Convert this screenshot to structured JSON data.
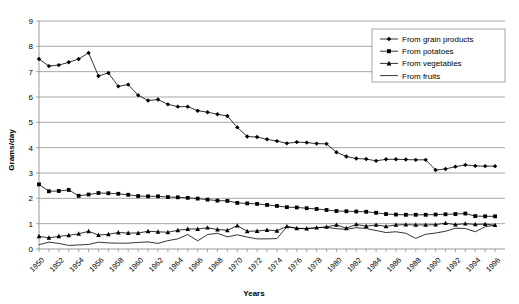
{
  "chart_data": {
    "type": "line",
    "title": "",
    "xlabel": "Years",
    "ylabel": "Grams/day",
    "xlim": [
      1950,
      1997
    ],
    "ylim": [
      0,
      9
    ],
    "ytick_values": [
      0,
      1,
      2,
      3,
      4,
      5,
      6,
      7,
      8,
      9
    ],
    "ytick_labels": [
      "0",
      "1",
      "2",
      "3",
      "4",
      "5",
      "6",
      "7",
      "8",
      "9"
    ],
    "xtick_labels": [
      "1950",
      "1952",
      "1954",
      "1956",
      "1958",
      "1960",
      "1962",
      "1964",
      "1966",
      "1968",
      "1970",
      "1972",
      "1974",
      "1976",
      "1978",
      "1980",
      "1982",
      "1984",
      "1986",
      "1988",
      "1990",
      "1992",
      "1994",
      "1996"
    ],
    "grid": "horizontal",
    "legend_position": "top-right",
    "x": [
      1950,
      1951,
      1952,
      1953,
      1954,
      1955,
      1956,
      1957,
      1958,
      1959,
      1960,
      1961,
      1962,
      1963,
      1964,
      1965,
      1966,
      1967,
      1968,
      1969,
      1970,
      1971,
      1972,
      1973,
      1974,
      1975,
      1976,
      1977,
      1978,
      1979,
      1980,
      1981,
      1982,
      1983,
      1984,
      1985,
      1986,
      1987,
      1988,
      1989,
      1990,
      1991,
      1992,
      1993,
      1994,
      1995,
      1996
    ],
    "series": [
      {
        "name": "From grain products",
        "marker": "diamond",
        "values": [
          7.5,
          7.22,
          7.26,
          7.37,
          7.5,
          7.74,
          6.83,
          6.95,
          6.42,
          6.49,
          6.07,
          5.86,
          5.9,
          5.71,
          5.62,
          5.62,
          5.46,
          5.4,
          5.32,
          5.25,
          4.8,
          4.44,
          4.42,
          4.33,
          4.26,
          4.17,
          4.22,
          4.2,
          4.16,
          4.15,
          3.82,
          3.65,
          3.57,
          3.55,
          3.48,
          3.54,
          3.54,
          3.53,
          3.52,
          3.52,
          3.12,
          3.16,
          3.25,
          3.32,
          3.28,
          3.27,
          3.27
        ]
      },
      {
        "name": "From potatoes",
        "marker": "square",
        "values": [
          2.55,
          2.28,
          2.29,
          2.33,
          2.1,
          2.15,
          2.21,
          2.2,
          2.18,
          2.14,
          2.09,
          2.08,
          2.08,
          2.05,
          2.04,
          2.02,
          1.99,
          1.95,
          1.91,
          1.9,
          1.82,
          1.8,
          1.78,
          1.74,
          1.7,
          1.65,
          1.64,
          1.61,
          1.58,
          1.54,
          1.5,
          1.49,
          1.48,
          1.47,
          1.43,
          1.38,
          1.36,
          1.35,
          1.35,
          1.35,
          1.36,
          1.37,
          1.38,
          1.4,
          1.3,
          1.29,
          1.29
        ]
      },
      {
        "name": "From vegetables",
        "marker": "triangle",
        "values": [
          0.5,
          0.44,
          0.5,
          0.54,
          0.6,
          0.7,
          0.55,
          0.58,
          0.65,
          0.63,
          0.63,
          0.7,
          0.68,
          0.66,
          0.74,
          0.79,
          0.79,
          0.84,
          0.77,
          0.74,
          0.92,
          0.7,
          0.71,
          0.75,
          0.72,
          0.89,
          0.82,
          0.81,
          0.84,
          0.87,
          0.95,
          0.82,
          0.97,
          0.9,
          0.95,
          0.89,
          0.95,
          0.96,
          0.95,
          0.95,
          0.96,
          1.02,
          0.96,
          1.0,
          0.97,
          0.98,
          0.94
        ]
      },
      {
        "name": "From fruits",
        "marker": "none",
        "values": [
          0.17,
          0.27,
          0.22,
          0.14,
          0.16,
          0.18,
          0.27,
          0.24,
          0.23,
          0.23,
          0.26,
          0.28,
          0.22,
          0.33,
          0.4,
          0.57,
          0.32,
          0.57,
          0.62,
          0.48,
          0.56,
          0.47,
          0.4,
          0.4,
          0.41,
          0.88,
          0.81,
          0.8,
          0.84,
          0.86,
          0.8,
          0.78,
          0.84,
          0.81,
          0.73,
          0.65,
          0.68,
          0.62,
          0.42,
          0.58,
          0.63,
          0.7,
          0.82,
          0.81,
          0.68,
          0.88,
          0.94
        ]
      }
    ]
  },
  "legend": {
    "items": [
      {
        "label": "From grain products",
        "marker": "diamond"
      },
      {
        "label": "From potatoes",
        "marker": "square"
      },
      {
        "label": "From vegetables",
        "marker": "triangle"
      },
      {
        "label": "From fruits",
        "marker": "none"
      }
    ]
  }
}
